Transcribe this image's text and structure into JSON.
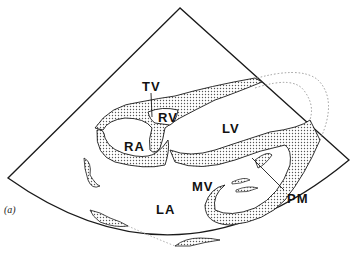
{
  "figure": {
    "panel_label": "(a)",
    "type": "echocardiogram apical four-chamber schematic",
    "labels": {
      "tv": "TV",
      "rv": "RV",
      "ra": "RA",
      "lv": "LV",
      "mv": "MV",
      "la": "LA",
      "pm": "PM"
    },
    "colors": {
      "outline": "#1a1a1a",
      "stipple": "#8a8a8a",
      "background": "#ffffff"
    }
  }
}
